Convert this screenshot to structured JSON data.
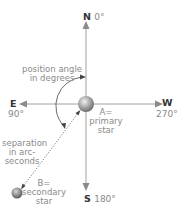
{
  "directions": {
    "north": {
      "letter": "N",
      "degrees": "0°"
    },
    "east": {
      "letter": "E",
      "degrees": "90°"
    },
    "south": {
      "letter": "S",
      "degrees": "180°"
    },
    "west": {
      "letter": "W",
      "degrees": "270°"
    }
  },
  "labels": {
    "position_angle": [
      "position angle",
      "in degrees"
    ],
    "separation": [
      "separation",
      "in arc-",
      "seconds"
    ],
    "primary": [
      "A=",
      "primary",
      "star"
    ],
    "secondary": [
      "B=",
      "secondary",
      "star"
    ]
  },
  "colors": {
    "axis": "#9a9a9a",
    "arrow": "#8a8a8a",
    "arc": "#333333",
    "star": "#888888",
    "text": "#8a8a8a"
  }
}
